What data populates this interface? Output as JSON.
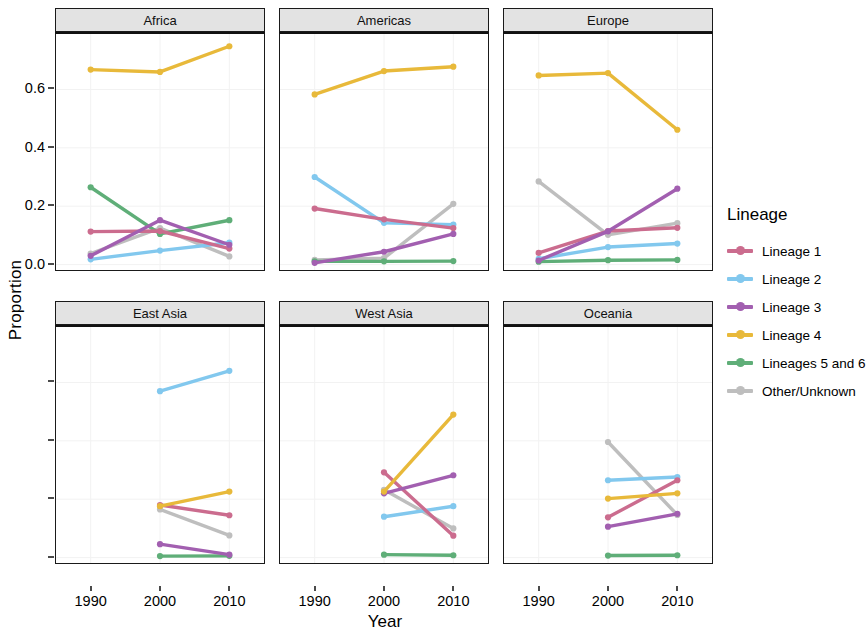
{
  "chart_data": {
    "type": "line",
    "title": "",
    "xlabel": "Year",
    "ylabel": "Proportion",
    "x": [
      1990,
      2000,
      2010
    ],
    "xticklabels": [
      "1990",
      "2000",
      "2010"
    ],
    "yticklabels": [
      "0.0",
      "0.2",
      "0.4",
      "0.6"
    ],
    "ytickvalues": [
      0.0,
      0.2,
      0.4,
      0.6
    ],
    "ylim": [
      -0.02,
      0.79
    ],
    "xlim": [
      1985,
      2015
    ],
    "grid": true,
    "legend_position": "right",
    "legend_title": "Lineage",
    "facet_layout": [
      [
        "Africa",
        "Americas",
        "Europe"
      ],
      [
        "East Asia",
        "West Asia",
        "Oceania"
      ]
    ],
    "series_names": [
      "Lineage 1",
      "Lineage 2",
      "Lineage 3",
      "Lineage 4",
      "Lineages 5 and 6",
      "Other/Unknown"
    ],
    "colors": {
      "Lineage 1": "#CB6C8E",
      "Lineage 2": "#82C8EE",
      "Lineage 3": "#A濃",
      "Lineage 4": "#E8B93A",
      "Lineages 5 and 6": "#5FAE78",
      "Other/Unknown": "#BEBEBE"
    },
    "panels": [
      {
        "facet": "Africa",
        "series": [
          {
            "name": "Lineage 1",
            "x": [
              1990,
              2000,
              2010
            ],
            "values": [
              0.113,
              0.115,
              0.055
            ]
          },
          {
            "name": "Lineage 2",
            "x": [
              1990,
              2000,
              2010
            ],
            "values": [
              0.018,
              0.048,
              0.075
            ]
          },
          {
            "name": "Lineage 3",
            "x": [
              1990,
              2000,
              2010
            ],
            "values": [
              0.03,
              0.152,
              0.068
            ]
          },
          {
            "name": "Lineage 4",
            "x": [
              1990,
              2000,
              2010
            ],
            "values": [
              0.668,
              0.66,
              0.748
            ]
          },
          {
            "name": "Lineages 5 and 6",
            "x": [
              1990,
              2000,
              2010
            ],
            "values": [
              0.265,
              0.105,
              0.152
            ]
          },
          {
            "name": "Other/Unknown",
            "x": [
              1990,
              2000,
              2010
            ],
            "values": [
              0.038,
              0.125,
              0.028
            ]
          }
        ]
      },
      {
        "facet": "Americas",
        "series": [
          {
            "name": "Lineage 1",
            "x": [
              1990,
              2000,
              2010
            ],
            "values": [
              0.192,
              0.155,
              0.125
            ]
          },
          {
            "name": "Lineage 2",
            "x": [
              1990,
              2000,
              2010
            ],
            "values": [
              0.3,
              0.143,
              0.137
            ]
          },
          {
            "name": "Lineage 3",
            "x": [
              1990,
              2000,
              2010
            ],
            "values": [
              0.006,
              0.044,
              0.105
            ]
          },
          {
            "name": "Lineage 4",
            "x": [
              1990,
              2000,
              2010
            ],
            "values": [
              0.583,
              0.663,
              0.678
            ]
          },
          {
            "name": "Lineages 5 and 6",
            "x": [
              1990,
              2000,
              2010
            ],
            "values": [
              0.011,
              0.011,
              0.012
            ]
          },
          {
            "name": "Other/Unknown",
            "x": [
              1990,
              2000,
              2010
            ],
            "values": [
              0.016,
              0.022,
              0.208
            ]
          }
        ]
      },
      {
        "facet": "Europe",
        "series": [
          {
            "name": "Lineage 1",
            "x": [
              1990,
              2000,
              2010
            ],
            "values": [
              0.04,
              0.115,
              0.126
            ]
          },
          {
            "name": "Lineage 2",
            "x": [
              1990,
              2000,
              2010
            ],
            "values": [
              0.02,
              0.06,
              0.072
            ]
          },
          {
            "name": "Lineage 3",
            "x": [
              1990,
              2000,
              2010
            ],
            "values": [
              0.014,
              0.114,
              0.26
            ]
          },
          {
            "name": "Lineage 4",
            "x": [
              1990,
              2000,
              2010
            ],
            "values": [
              0.648,
              0.656,
              0.462
            ]
          },
          {
            "name": "Lineages 5 and 6",
            "x": [
              1990,
              2000,
              2010
            ],
            "values": [
              0.01,
              0.015,
              0.016
            ]
          },
          {
            "name": "Other/Unknown",
            "x": [
              1990,
              2000,
              2010
            ],
            "values": [
              0.285,
              0.102,
              0.142
            ]
          }
        ]
      },
      {
        "facet": "East Asia",
        "series": [
          {
            "name": "Lineage 1",
            "x": [
              2000,
              2010
            ],
            "values": [
              0.18,
              0.145
            ]
          },
          {
            "name": "Lineage 2",
            "x": [
              2000,
              2010
            ],
            "values": [
              0.57,
              0.64
            ]
          },
          {
            "name": "Lineage 3",
            "x": [
              2000,
              2010
            ],
            "values": [
              0.046,
              0.01
            ]
          },
          {
            "name": "Lineage 4",
            "x": [
              2000,
              2010
            ],
            "values": [
              0.176,
              0.226
            ]
          },
          {
            "name": "Lineages 5 and 6",
            "x": [
              2000,
              2010
            ],
            "values": [
              0.005,
              0.006
            ]
          },
          {
            "name": "Other/Unknown",
            "x": [
              2000,
              2010
            ],
            "values": [
              0.165,
              0.076
            ]
          }
        ]
      },
      {
        "facet": "West Asia",
        "series": [
          {
            "name": "Lineage 1",
            "x": [
              2000,
              2010
            ],
            "values": [
              0.292,
              0.075
            ]
          },
          {
            "name": "Lineage 2",
            "x": [
              2000,
              2010
            ],
            "values": [
              0.14,
              0.176
            ]
          },
          {
            "name": "Lineage 3",
            "x": [
              2000,
              2010
            ],
            "values": [
              0.22,
              0.282
            ]
          },
          {
            "name": "Lineage 4",
            "x": [
              2000,
              2010
            ],
            "values": [
              0.226,
              0.49
            ]
          },
          {
            "name": "Lineages 5 and 6",
            "x": [
              2000,
              2010
            ],
            "values": [
              0.01,
              0.008
            ]
          },
          {
            "name": "Other/Unknown",
            "x": [
              2000,
              2010
            ],
            "values": [
              0.232,
              0.1
            ]
          }
        ]
      },
      {
        "facet": "Oceania",
        "series": [
          {
            "name": "Lineage 1",
            "x": [
              2000,
              2010
            ],
            "values": [
              0.138,
              0.265
            ]
          },
          {
            "name": "Lineage 2",
            "x": [
              2000,
              2010
            ],
            "values": [
              0.265,
              0.276
            ]
          },
          {
            "name": "Lineage 3",
            "x": [
              2000,
              2010
            ],
            "values": [
              0.106,
              0.15
            ]
          },
          {
            "name": "Lineage 4",
            "x": [
              2000,
              2010
            ],
            "values": [
              0.202,
              0.22
            ]
          },
          {
            "name": "Lineages 5 and 6",
            "x": [
              2000,
              2010
            ],
            "values": [
              0.007,
              0.008
            ]
          },
          {
            "name": "Other/Unknown",
            "x": [
              2000,
              2010
            ],
            "values": [
              0.396,
              0.146
            ]
          }
        ]
      }
    ]
  },
  "axes": {
    "ylabel": "Proportion",
    "xlabel": "Year",
    "yticks": [
      "0.0",
      "0.2",
      "0.4",
      "0.6"
    ],
    "xticks": [
      "1990",
      "2000",
      "2010"
    ]
  },
  "legend": {
    "title": "Lineage",
    "items": [
      {
        "label": "Lineage 1",
        "color": "#CB6C8E"
      },
      {
        "label": "Lineage 2",
        "color": "#82C8EE"
      },
      {
        "label": "Lineage 3",
        "color": "#A濃"
      },
      {
        "label": "Lineage 4",
        "color": "#E8B93A"
      },
      {
        "label": "Lineages 5 and 6",
        "color": "#5FAE78"
      },
      {
        "label": "Other/Unknown",
        "color": "#BEBEBE"
      }
    ]
  },
  "facets": [
    {
      "label": "Africa"
    },
    {
      "label": "Americas"
    },
    {
      "label": "Europe"
    },
    {
      "label": "East Asia"
    },
    {
      "label": "West Asia"
    },
    {
      "label": "Oceania"
    }
  ]
}
